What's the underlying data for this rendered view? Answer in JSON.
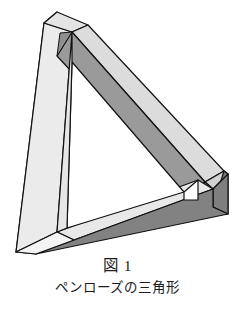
{
  "figure": {
    "name": "penrose-triangle",
    "alt_name": "impossible-tribar",
    "caption_number": "図 1",
    "caption_title": "ペンローズの三角形",
    "colors": {
      "outline": "#111111",
      "background": "#ffffff",
      "face_white": "#ffffff",
      "face_light": "#ebebeb",
      "face_light2": "#e0e0e0",
      "face_mid": "#bdbdbd",
      "face_gray": "#9a9a9a",
      "face_dark": "#808080",
      "face_darker": "#6e6e6e"
    },
    "geometry": {
      "apex": [
        57,
        12
      ],
      "bottom_left": [
        16,
        252
      ],
      "bottom_right": [
        228,
        214
      ]
    }
  }
}
